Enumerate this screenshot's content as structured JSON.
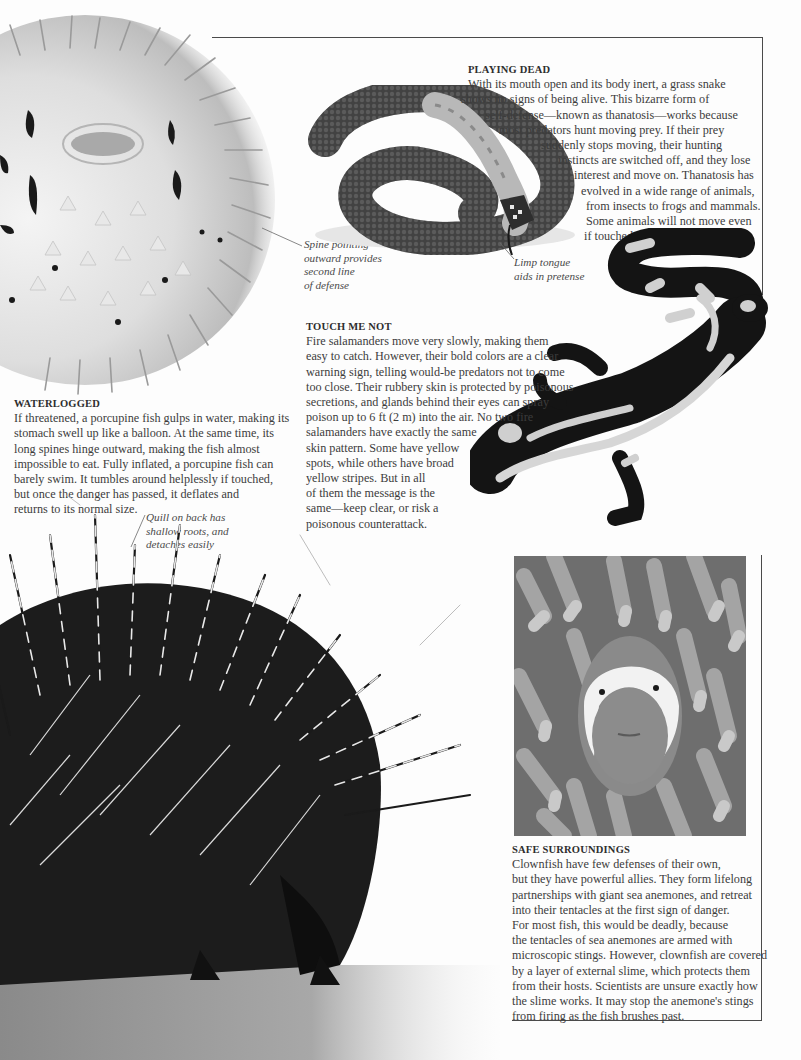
{
  "page": {
    "background": "#fdfdfd",
    "text_color": "#3c3c3c",
    "rule_color": "#4a4a4a"
  },
  "figures": {
    "porcupine_fish": {
      "label": "Inflated porcupine fish"
    },
    "grass_snake": {
      "label": "Grass snake playing dead"
    },
    "fire_salamander": {
      "label": "Fire salamander"
    },
    "porcupine": {
      "label": "Crested porcupine with raised quills"
    },
    "clownfish": {
      "label": "Clownfish among sea anemone tentacles"
    }
  },
  "sections": {
    "playing_dead": {
      "heading": "PLAYING DEAD",
      "lines": [
        "With its mouth open and its body inert, a grass snake",
        "shows no signs of being alive. This bizarre form of",
        "self-defense—known as thanatosis—works because",
        "most predators hunt moving prey. If their prey",
        "suddenly stops moving, their hunting",
        "instincts are switched off, and they lose",
        "interest and move on. Thanatosis has",
        "evolved in a wide range of animals,",
        "from insects to frogs and mammals.",
        "Some animals will not move even",
        "if touched."
      ]
    },
    "waterlogged": {
      "heading": "WATERLOGGED",
      "lines": [
        "If threatened, a porcupine fish gulps in water, making its",
        "stomach swell up like a balloon. At the same time, its",
        "long spines hinge outward, making the fish almost",
        "impossible to eat. Fully inflated, a porcupine fish can",
        "barely swim. It tumbles around helplessly if touched,",
        "but once the danger has passed, it deflates and",
        "returns to its normal size."
      ]
    },
    "touch_me_not": {
      "heading": "TOUCH ME NOT",
      "lines": [
        "Fire salamanders move very slowly, making them",
        "easy to catch. However, their bold colors are a clear",
        "warning sign, telling would-be predators not to come",
        "too close. Their rubbery skin is protected by poisonous",
        "secretions, and glands behind their eyes can spray",
        "poison up to 6 ft (2 m) into the air. No two fire",
        "salamanders have exactly the same",
        "skin pattern. Some have yellow",
        "spots, while others have broad",
        "yellow stripes. But in all",
        "of them the message is the",
        "same—keep clear, or risk a",
        "poisonous counterattack."
      ]
    },
    "safe_surroundings": {
      "heading": "SAFE SURROUNDINGS",
      "lines": [
        "Clownfish have few defenses of their own,",
        "but they have powerful allies. They form lifelong",
        "partnerships with giant sea anemones, and retreat",
        "into their tentacles at the first sign of danger.",
        "For most fish, this would be deadly, because",
        "the tentacles of sea anemones are armed with",
        "microscopic stings. However, clownfish are covered",
        "by a layer of external slime, which protects them",
        "from their hosts. Scientists are unsure exactly how",
        "the slime works. It may stop the anemone's stings",
        "from firing as the fish brushes past."
      ]
    }
  },
  "captions": {
    "spine": [
      "Spine pointing",
      "outward provides",
      "second line",
      "of defense"
    ],
    "tongue": [
      "Limp tongue",
      "aids in pretense"
    ],
    "quill": [
      "Quill on back has",
      "shallow roots, and",
      "detaches easily"
    ]
  }
}
